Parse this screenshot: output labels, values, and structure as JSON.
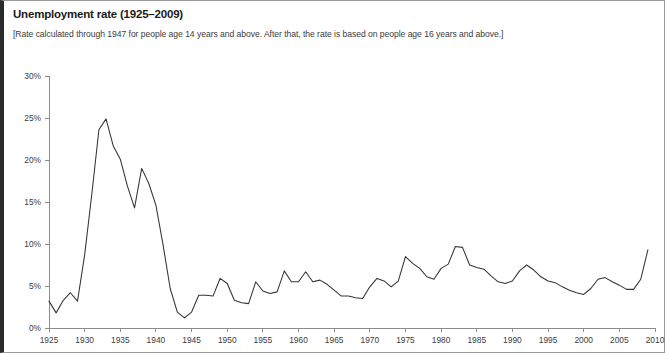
{
  "chart_data": {
    "type": "line",
    "title": "Unemployment rate (1925–2009)",
    "subtitle": "[Rate calculated through 1947 for people age 14 years and above. After that, the rate is based on people age 16 years and above.]",
    "xlabel": "",
    "ylabel": "",
    "xlim": [
      1925,
      2010
    ],
    "ylim": [
      0,
      30
    ],
    "grid": false,
    "legend": "none",
    "line_color": "#333333",
    "axis_color": "#8c8c8c",
    "y_ticks": [
      0,
      5,
      10,
      15,
      20,
      25,
      30
    ],
    "y_tick_labels": [
      "0%",
      "5%",
      "10%",
      "15%",
      "20%",
      "25%",
      "30%"
    ],
    "x_ticks": [
      1925,
      1930,
      1935,
      1940,
      1945,
      1950,
      1955,
      1960,
      1965,
      1970,
      1975,
      1980,
      1985,
      1990,
      1995,
      2000,
      2005,
      2010
    ],
    "x_tick_labels": [
      "1925",
      "1930",
      "1935",
      "1940",
      "1945",
      "1950",
      "1955",
      "1960",
      "1965",
      "1970",
      "1975",
      "1980",
      "1985",
      "1990",
      "1995",
      "2000",
      "2005",
      "2010"
    ],
    "series": [
      {
        "name": "Unemployment rate",
        "x": [
          1925,
          1926,
          1927,
          1928,
          1929,
          1930,
          1931,
          1932,
          1933,
          1934,
          1935,
          1936,
          1937,
          1938,
          1939,
          1940,
          1941,
          1942,
          1943,
          1944,
          1945,
          1946,
          1947,
          1948,
          1949,
          1950,
          1951,
          1952,
          1953,
          1954,
          1955,
          1956,
          1957,
          1958,
          1959,
          1960,
          1961,
          1962,
          1963,
          1964,
          1965,
          1966,
          1967,
          1968,
          1969,
          1970,
          1971,
          1972,
          1973,
          1974,
          1975,
          1976,
          1977,
          1978,
          1979,
          1980,
          1981,
          1982,
          1983,
          1984,
          1985,
          1986,
          1987,
          1988,
          1989,
          1990,
          1991,
          1992,
          1993,
          1994,
          1995,
          1996,
          1997,
          1998,
          1999,
          2000,
          2001,
          2002,
          2003,
          2004,
          2005,
          2006,
          2007,
          2008,
          2009
        ],
        "values": [
          3.2,
          1.8,
          3.3,
          4.2,
          3.2,
          8.7,
          15.9,
          23.6,
          24.9,
          21.7,
          20.1,
          16.9,
          14.3,
          19.0,
          17.2,
          14.6,
          9.9,
          4.7,
          1.9,
          1.2,
          1.9,
          3.9,
          3.9,
          3.8,
          5.9,
          5.3,
          3.3,
          3.0,
          2.9,
          5.5,
          4.4,
          4.1,
          4.3,
          6.8,
          5.5,
          5.5,
          6.7,
          5.5,
          5.7,
          5.2,
          4.5,
          3.8,
          3.8,
          3.6,
          3.5,
          4.9,
          5.9,
          5.6,
          4.9,
          5.6,
          8.5,
          7.7,
          7.1,
          6.1,
          5.8,
          7.1,
          7.6,
          9.7,
          9.6,
          7.5,
          7.2,
          7.0,
          6.2,
          5.5,
          5.3,
          5.6,
          6.8,
          7.5,
          6.9,
          6.1,
          5.6,
          5.4,
          4.9,
          4.5,
          4.2,
          4.0,
          4.7,
          5.8,
          6.0,
          5.5,
          5.1,
          4.6,
          4.6,
          5.8,
          9.3
        ]
      }
    ]
  }
}
